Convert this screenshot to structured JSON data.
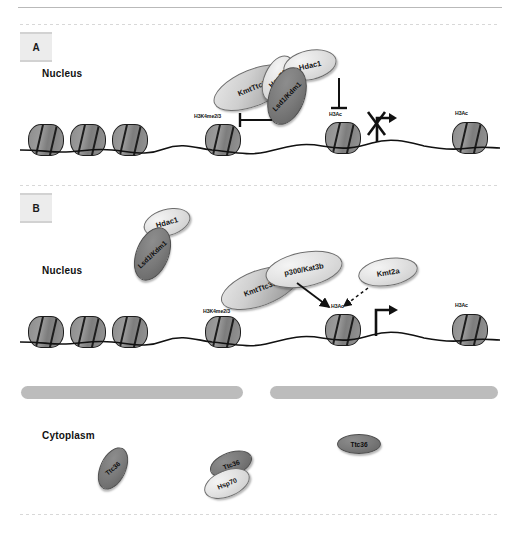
{
  "figure": {
    "panels": [
      {
        "id": "A",
        "letter": "A",
        "compartment": "Nucleus",
        "proteins": [
          {
            "name": "KmtTtc36",
            "shade": "mid"
          },
          {
            "name": "Hsp70",
            "shade": "light"
          },
          {
            "name": "Hdac1",
            "shade": "light"
          },
          {
            "name": "Lsd1/Kdm1",
            "shade": "dark"
          }
        ],
        "marks": [
          {
            "label": "H3K4me2/3"
          },
          {
            "label": "H3Ac"
          },
          {
            "label": "H3Ac"
          }
        ],
        "transcription": {
          "state": "blocked"
        }
      },
      {
        "id": "B",
        "letter": "B",
        "compartment": "Nucleus",
        "proteins": [
          {
            "name": "Hdac1",
            "shade": "light"
          },
          {
            "name": "Lsd1/Kdm1",
            "shade": "dark"
          },
          {
            "name": "KmtTtc36",
            "shade": "mid"
          },
          {
            "name": "p300/Kat3b",
            "shade": "light"
          },
          {
            "name": "Kmt2a",
            "shade": "light"
          }
        ],
        "marks": [
          {
            "label": "H3K4me2/3"
          },
          {
            "label": "H3Ac"
          },
          {
            "label": "H3Ac"
          }
        ],
        "transcription": {
          "state": "active"
        }
      },
      {
        "id": "C",
        "compartment": "Cytoplasm",
        "proteins": [
          {
            "name": "Ttc36",
            "shade": "dark"
          },
          {
            "name": "Ttc36",
            "shade": "dark"
          },
          {
            "name": "Hsp70",
            "shade": "light"
          },
          {
            "name": "Ttc36",
            "shade": "dark"
          }
        ]
      }
    ],
    "colors": {
      "nucleosome_fill": "#8e8e8e",
      "nucleosome_stroke": "#1d1d1d",
      "membrane": "#bcbcbc",
      "panel_chip": "#ececec",
      "dna_strand": "#111111"
    }
  }
}
